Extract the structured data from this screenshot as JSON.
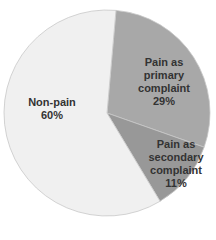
{
  "chart_data": {
    "type": "pie",
    "title": "",
    "categories": [
      "Pain as primary complaint",
      "Pain as secondary complaint",
      "Non-pain"
    ],
    "values": [
      29,
      11,
      60
    ],
    "unit": "%",
    "colors": [
      "#a8a8a8",
      "#989898",
      "#f0f0f0"
    ],
    "labels": [
      {
        "lines": [
          "Pain as",
          "primary",
          "complaint",
          "29%"
        ]
      },
      {
        "lines": [
          "Pain as",
          "secondary",
          "complaint",
          "11%"
        ]
      },
      {
        "lines": [
          "Non-pain",
          "60%"
        ]
      }
    ]
  }
}
